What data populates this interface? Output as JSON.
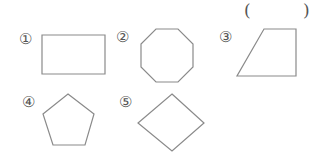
{
  "answer_blank": {
    "open": "(",
    "close": ")"
  },
  "items": [
    {
      "label": "①",
      "shape": "rectangle",
      "points": "42,35 105,35 105,74 42,74"
    },
    {
      "label": "②",
      "shape": "octagon",
      "points": "156,29 178,29 193,44 193,67 178,82 156,82 141,67 141,44"
    },
    {
      "label": "③",
      "shape": "trapezoid",
      "points": "264,29 296,29 296,76 237,76"
    },
    {
      "label": "④",
      "shape": "pentagon",
      "points": "68,94 94,114 85,145 53,145 43,114"
    },
    {
      "label": "⑤",
      "shape": "rhombus",
      "points": "172,94 204,123 172,151 138,123"
    }
  ],
  "colors": {
    "stroke": "#8a8a8a",
    "text": "#555555"
  }
}
